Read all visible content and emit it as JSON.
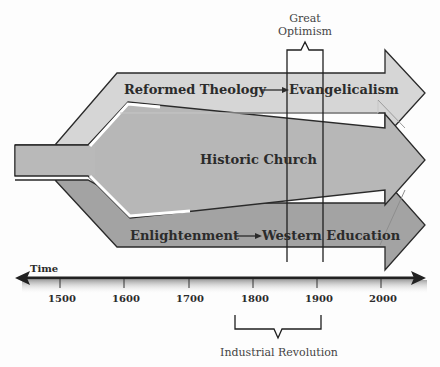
{
  "diagram": {
    "type": "timeline-flow",
    "title_partial": "",
    "colors": {
      "top_arrow": "#d3d3d3",
      "middle_arrow": "#b5b5b5",
      "bottom_arrow": "#a0a0a0",
      "stroke": "#2a2a2a",
      "axis": "#222222"
    },
    "streams": [
      {
        "id": "top",
        "from": "Reformed Theology",
        "to": "Evangelicalism",
        "arrow": "→"
      },
      {
        "id": "middle",
        "label": "Historic Church"
      },
      {
        "id": "bottom",
        "from": "Enlightenment",
        "to": "Western Education",
        "arrow": "→"
      }
    ],
    "labels": {
      "top_from": "Reformed Theology",
      "top_to": "Evangelicalism",
      "middle": "Historic Church",
      "bottom_from": "Enlightenment",
      "bottom_to": "Western Education"
    },
    "brackets": {
      "great_optimism": {
        "line1": "Great",
        "line2": "Optimism",
        "start_year": 1850,
        "end_year": 1905
      },
      "industrial_revolution": {
        "label": "Industrial Revolution",
        "start_year": 1775,
        "end_year": 1905
      }
    },
    "timeline": {
      "label": "Time",
      "ticks": [
        "1500",
        "1600",
        "1700",
        "1800",
        "1900",
        "2000"
      ]
    }
  }
}
